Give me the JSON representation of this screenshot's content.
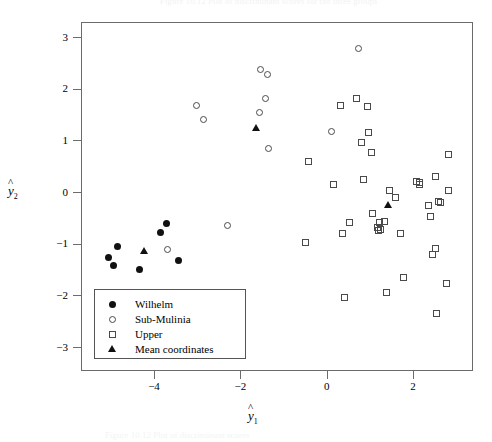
{
  "figure": {
    "top_caption_ghost": "Figure 10.12 Plot of discriminant scores for the three groups",
    "bottom_caption_ghost": "Figure 10.12 Plot of discriminant scores"
  },
  "axes": {
    "x_title": "y",
    "x_title_sub": "1",
    "x_title_hat": "^",
    "y_title": "y",
    "y_title_sub": "2",
    "y_title_hat": "^",
    "x_ticks": [
      "-4",
      "-2",
      "0",
      "2"
    ],
    "x_tick_values": [
      -4,
      -2,
      0,
      2
    ],
    "y_ticks": [
      "3",
      "2",
      "1",
      "0",
      "-1",
      "-2",
      "-3"
    ],
    "y_tick_values": [
      3,
      2,
      1,
      0,
      -1,
      -2,
      -3
    ],
    "xlim": [
      -5.55,
      3.5
    ],
    "ylim": [
      -3.4,
      3.4
    ],
    "frame_color": "#6b6b6b"
  },
  "legend": {
    "items": [
      {
        "label": "Wilhelm",
        "marker": "filled-circle",
        "series": "wilhelm"
      },
      {
        "label": "Sub-Mulinia",
        "marker": "open-circle",
        "series": "submulinia"
      },
      {
        "label": "Upper",
        "marker": "open-square",
        "series": "upper"
      },
      {
        "label": "Mean coordinates",
        "marker": "filled-triangle",
        "series": "mean"
      }
    ]
  },
  "chart_data": {
    "type": "scatter",
    "title": "",
    "xlabel": "y-hat 1",
    "ylabel": "y-hat 2",
    "xlim": [
      -5.55,
      3.5
    ],
    "ylim": [
      -3.4,
      3.4
    ],
    "grid": false,
    "legend_position": "lower-left-inside",
    "series": [
      {
        "name": "Wilhelm",
        "marker": "filled-circle",
        "color": "#111111",
        "points": [
          [
            -5.08,
            -1.24
          ],
          [
            -4.97,
            -1.4
          ],
          [
            -4.88,
            -1.03
          ],
          [
            -4.35,
            -1.48
          ],
          [
            -3.87,
            -0.76
          ],
          [
            -3.73,
            -0.59
          ],
          [
            -3.46,
            -1.3
          ]
        ]
      },
      {
        "name": "Sub-Mulinia",
        "marker": "open-circle",
        "color": "#4a4a4a",
        "points": [
          [
            -3.03,
            1.7
          ],
          [
            -2.87,
            1.43
          ],
          [
            -1.56,
            2.4
          ],
          [
            -1.4,
            2.29
          ],
          [
            -1.43,
            1.83
          ],
          [
            -1.57,
            1.55
          ],
          [
            -1.38,
            0.87
          ],
          [
            0.72,
            2.8
          ],
          [
            0.09,
            1.2
          ],
          [
            -2.32,
            -0.62
          ],
          [
            -3.71,
            -1.09
          ]
        ]
      },
      {
        "name": "Upper",
        "marker": "open-square",
        "color": "#4a4a4a",
        "points": [
          [
            0.3,
            1.7
          ],
          [
            0.66,
            1.82
          ],
          [
            0.92,
            1.68
          ],
          [
            0.94,
            1.17
          ],
          [
            0.78,
            0.97
          ],
          [
            1.02,
            0.79
          ],
          [
            2.79,
            0.74
          ],
          [
            -0.45,
            0.61
          ],
          [
            0.13,
            0.16
          ],
          [
            0.82,
            0.26
          ],
          [
            2.06,
            0.23
          ],
          [
            2.13,
            0.21
          ],
          [
            2.13,
            0.16
          ],
          [
            2.49,
            0.31
          ],
          [
            2.79,
            0.04
          ],
          [
            1.43,
            0.05
          ],
          [
            1.56,
            -0.09
          ],
          [
            2.34,
            -0.24
          ],
          [
            2.56,
            -0.17
          ],
          [
            2.62,
            -0.18
          ],
          [
            2.39,
            -0.45
          ],
          [
            1.03,
            -0.39
          ],
          [
            0.5,
            -0.57
          ],
          [
            1.21,
            -0.57
          ],
          [
            1.32,
            -0.56
          ],
          [
            0.35,
            -0.79
          ],
          [
            1.16,
            -0.66
          ],
          [
            1.22,
            -0.7
          ],
          [
            1.17,
            -0.73
          ],
          [
            1.69,
            -0.79
          ],
          [
            -0.52,
            -0.95
          ],
          [
            2.5,
            -1.07
          ],
          [
            2.44,
            -1.19
          ],
          [
            1.76,
            -1.64
          ],
          [
            2.76,
            -1.76
          ],
          [
            1.36,
            -1.92
          ],
          [
            0.38,
            -2.02
          ],
          [
            2.53,
            -2.33
          ]
        ]
      },
      {
        "name": "Mean coordinates",
        "marker": "filled-triangle",
        "color": "#111111",
        "points": [
          [
            -4.25,
            -1.13
          ],
          [
            -1.66,
            1.25
          ],
          [
            1.4,
            -0.24
          ]
        ]
      }
    ]
  }
}
